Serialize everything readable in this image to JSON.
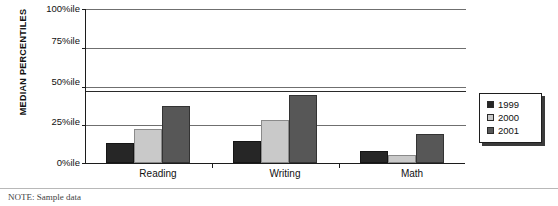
{
  "chart_data": {
    "type": "bar",
    "title": "",
    "subtitle": "",
    "xlabel": "",
    "ylabel": "MEDIAN PERCENTILES",
    "categories": [
      "Reading",
      "Writing",
      "Math"
    ],
    "series": [
      {
        "name": "1999",
        "color": "#262626",
        "values": [
          13,
          14,
          8
        ]
      },
      {
        "name": "2000",
        "color": "#c9c9c9",
        "values": [
          22,
          28,
          5
        ]
      },
      {
        "name": "2001",
        "color": "#575757",
        "values": [
          37,
          44,
          19
        ]
      }
    ],
    "ylim": [
      0,
      100
    ],
    "yticks": [
      0,
      25,
      50,
      75,
      100
    ],
    "ytick_labels": [
      "0%ile",
      "25%ile",
      "50%ile",
      "75%ile",
      "100%ile"
    ],
    "grid": true,
    "grid_axis": "y",
    "legend_position": "right",
    "annotations": [
      {
        "name": "reference-line",
        "value": 47,
        "style": "heavy"
      }
    ]
  },
  "axis": {
    "y_title": "MEDIAN PERCENTILES",
    "ticks": [
      {
        "label": "100%ile",
        "value": 100
      },
      {
        "label": "75%ile",
        "value": 75
      },
      {
        "label": "50%ile",
        "value": 50
      },
      {
        "label": "25%ile",
        "value": 25
      },
      {
        "label": "0%ile",
        "value": 0
      }
    ]
  },
  "categories": [
    {
      "label": "Reading"
    },
    {
      "label": "Writing"
    },
    {
      "label": "Math"
    }
  ],
  "legend": {
    "entries": [
      {
        "label": "1999",
        "color": "#262626"
      },
      {
        "label": "2000",
        "color": "#c9c9c9"
      },
      {
        "label": "2001",
        "color": "#575757"
      }
    ]
  },
  "footer": {
    "note": "NOTE: Sample data"
  }
}
